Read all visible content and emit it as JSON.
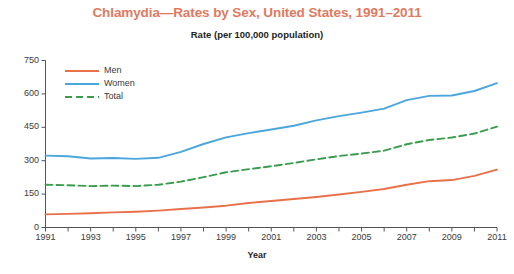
{
  "chart_data": {
    "type": "line",
    "title": "Chlamydia—Rates by Sex, United States, 1991–2011",
    "subtitle": "Rate (per 100,000 population)",
    "xlabel": "Year",
    "ylabel": "",
    "xlim": [
      1991,
      2011
    ],
    "ylim": [
      0,
      750
    ],
    "yticks": [
      0,
      150,
      300,
      450,
      600,
      750
    ],
    "ytick_labels": [
      "0",
      "150",
      "300",
      "450",
      "600",
      "750"
    ],
    "xticks": [
      1991,
      1992,
      1993,
      1994,
      1995,
      1996,
      1997,
      1998,
      1999,
      2000,
      2001,
      2002,
      2003,
      2004,
      2005,
      2006,
      2007,
      2008,
      2009,
      2010,
      2011
    ],
    "xtick_labels": [
      "1991",
      "",
      "1993",
      "",
      "1995",
      "",
      "1997",
      "",
      "1999",
      "",
      "2001",
      "",
      "2003",
      "",
      "2005",
      "",
      "2007",
      "",
      "2009",
      "",
      "2011"
    ],
    "grid": false,
    "legend_position": "upper-left-inside",
    "x": [
      1991,
      1992,
      1993,
      1994,
      1995,
      1996,
      1997,
      1998,
      1999,
      2000,
      2001,
      2002,
      2003,
      2004,
      2005,
      2006,
      2007,
      2008,
      2009,
      2010,
      2011
    ],
    "series": [
      {
        "name": "Men",
        "color": "#e8714a",
        "style": "solid",
        "values": [
          59,
          61,
          64,
          68,
          71,
          76,
          83,
          90,
          98,
          110,
          119,
          128,
          137,
          148,
          160,
          173,
          192,
          208,
          213,
          232,
          260
        ]
      },
      {
        "name": "Women",
        "color": "#4ba6dd",
        "style": "solid",
        "values": [
          323,
          320,
          310,
          312,
          308,
          313,
          340,
          375,
          405,
          424,
          440,
          457,
          481,
          500,
          516,
          534,
          572,
          591,
          593,
          613,
          648
        ]
      },
      {
        "name": "Total",
        "color": "#3a9c4d",
        "style": "dashed",
        "values": [
          192,
          190,
          186,
          188,
          186,
          192,
          206,
          226,
          248,
          262,
          275,
          290,
          306,
          321,
          332,
          345,
          374,
          393,
          404,
          422,
          453
        ]
      }
    ]
  },
  "legend": {
    "items": [
      {
        "label": "Men"
      },
      {
        "label": "Women"
      },
      {
        "label": "Total"
      }
    ]
  },
  "colors": {
    "title": "#e07a5f",
    "men": "#e8714a",
    "women": "#4ba6dd",
    "total": "#3a9c4d",
    "axis": "#555555",
    "text": "#231f20"
  }
}
